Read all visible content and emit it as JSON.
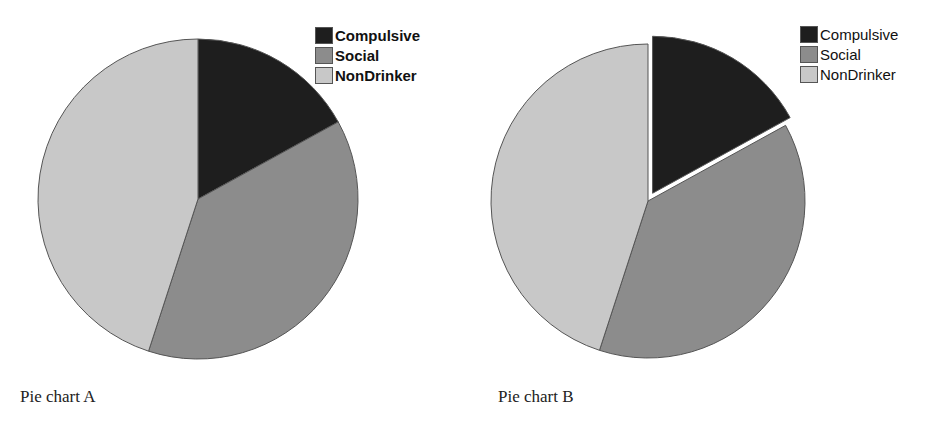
{
  "chart_data": [
    {
      "type": "pie",
      "title": "Pie chart A",
      "categories": [
        "Compulsive",
        "Social",
        "NonDrinker"
      ],
      "values": [
        17,
        38,
        45
      ],
      "colors": [
        "#1e1e1e",
        "#8c8c8c",
        "#c8c8c8"
      ],
      "exploded": [],
      "legend_position": "top-right"
    },
    {
      "type": "pie",
      "title": "Pie chart B",
      "categories": [
        "Compulsive",
        "Social",
        "NonDrinker"
      ],
      "values": [
        17,
        38,
        45
      ],
      "colors": [
        "#1e1e1e",
        "#8c8c8c",
        "#c8c8c8"
      ],
      "exploded": [
        "Compulsive"
      ],
      "legend_position": "top-right"
    }
  ],
  "legend": [
    {
      "label": "Compulsive",
      "color": "#1e1e1e"
    },
    {
      "label": "Social",
      "color": "#8c8c8c"
    },
    {
      "label": "NonDrinker",
      "color": "#c8c8c8"
    }
  ],
  "captions": {
    "a": "Pie chart A",
    "b": "Pie chart B"
  }
}
